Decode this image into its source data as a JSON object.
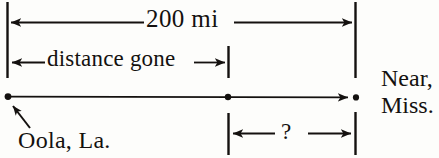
{
  "diagram": {
    "type": "distance-line-diagram",
    "background_color": "#fdfdfb",
    "ink_color": "#14110f",
    "total_label": "200 mi",
    "traveled_label": "distance gone",
    "unknown_label": "?",
    "origin_label": "Oola, La.",
    "destination_label_line1": "Near,",
    "destination_label_line2": "Miss.",
    "measures": [
      {
        "name": "total-distance",
        "label": "200 mi",
        "arrow_style": "double-headed",
        "from_x": 7,
        "to_x": 355,
        "y": 22
      },
      {
        "name": "distance-gone",
        "label": "distance gone",
        "arrow_style": "double-headed",
        "from_x": 7,
        "to_x": 228,
        "y": 62
      },
      {
        "name": "distance-remaining",
        "label": "?",
        "arrow_style": "double-headed",
        "from_x": 228,
        "to_x": 355,
        "y": 133
      }
    ],
    "route": {
      "name": "route-line",
      "y": 97,
      "start_x": 7,
      "mid_x": 228,
      "end_x": 355,
      "points": [
        {
          "name": "origin-point",
          "x": 7,
          "label": "Oola, La."
        },
        {
          "name": "current-position-point",
          "x": 228,
          "label": ""
        },
        {
          "name": "destination-point",
          "x": 355,
          "label": "Near, Miss."
        }
      ]
    },
    "ticks": [
      {
        "name": "left-boundary-tick",
        "x": 7,
        "y1": 2,
        "y2": 78
      },
      {
        "name": "right-boundary-tick",
        "x": 355,
        "y1": 2,
        "y2": 78
      },
      {
        "name": "middle-tick-upper",
        "x": 228,
        "y1": 46,
        "y2": 78
      },
      {
        "name": "middle-tick-lower",
        "x": 228,
        "y1": 113,
        "y2": 155
      },
      {
        "name": "right-boundary-tick-lower",
        "x": 355,
        "y1": 112,
        "y2": 155
      }
    ],
    "pointer": {
      "name": "origin-pointer-arrow",
      "from_x": 52,
      "from_y": 145,
      "to_x": 12,
      "to_y": 104
    }
  }
}
